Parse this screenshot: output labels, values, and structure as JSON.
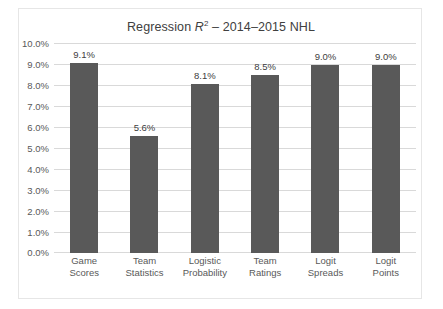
{
  "chart_data": {
    "type": "bar",
    "title_parts": {
      "prefix": "Regression ",
      "symbol": "R",
      "exponent": "2",
      "suffix": " – 2014–2015 NHL"
    },
    "categories": [
      "Game Scores",
      "Team Statistics",
      "Logistic Probability",
      "Team Ratings",
      "Logit Spreads",
      "Logit Points"
    ],
    "category_lines": [
      [
        "Game",
        "Scores"
      ],
      [
        "Team",
        "Statistics"
      ],
      [
        "Logistic",
        "Probability"
      ],
      [
        "Team",
        "Ratings"
      ],
      [
        "Logit",
        "Spreads"
      ],
      [
        "Logit",
        "Points"
      ]
    ],
    "values": [
      9.1,
      5.6,
      8.1,
      8.5,
      9.0,
      9.0
    ],
    "value_labels": [
      "9.1%",
      "5.6%",
      "8.1%",
      "8.5%",
      "9.0%",
      "9.0%"
    ],
    "xlabel": "",
    "ylabel": "",
    "ylim": [
      0,
      10
    ],
    "ytick_values": [
      10.0,
      9.0,
      8.0,
      7.0,
      6.0,
      5.0,
      4.0,
      3.0,
      2.0,
      1.0,
      0.0
    ],
    "ytick_labels": [
      "10.0%",
      "9.0%",
      "8.0%",
      "7.0%",
      "6.0%",
      "5.0%",
      "4.0%",
      "3.0%",
      "2.0%",
      "1.0%",
      "0.0%"
    ],
    "grid": true,
    "legend": false,
    "colors": {
      "bar": "#595959",
      "gridline": "#d9d9d9",
      "text": "#404040",
      "tick_text": "#595959",
      "frame_border": "#e6e6e6",
      "background": "#ffffff"
    }
  }
}
